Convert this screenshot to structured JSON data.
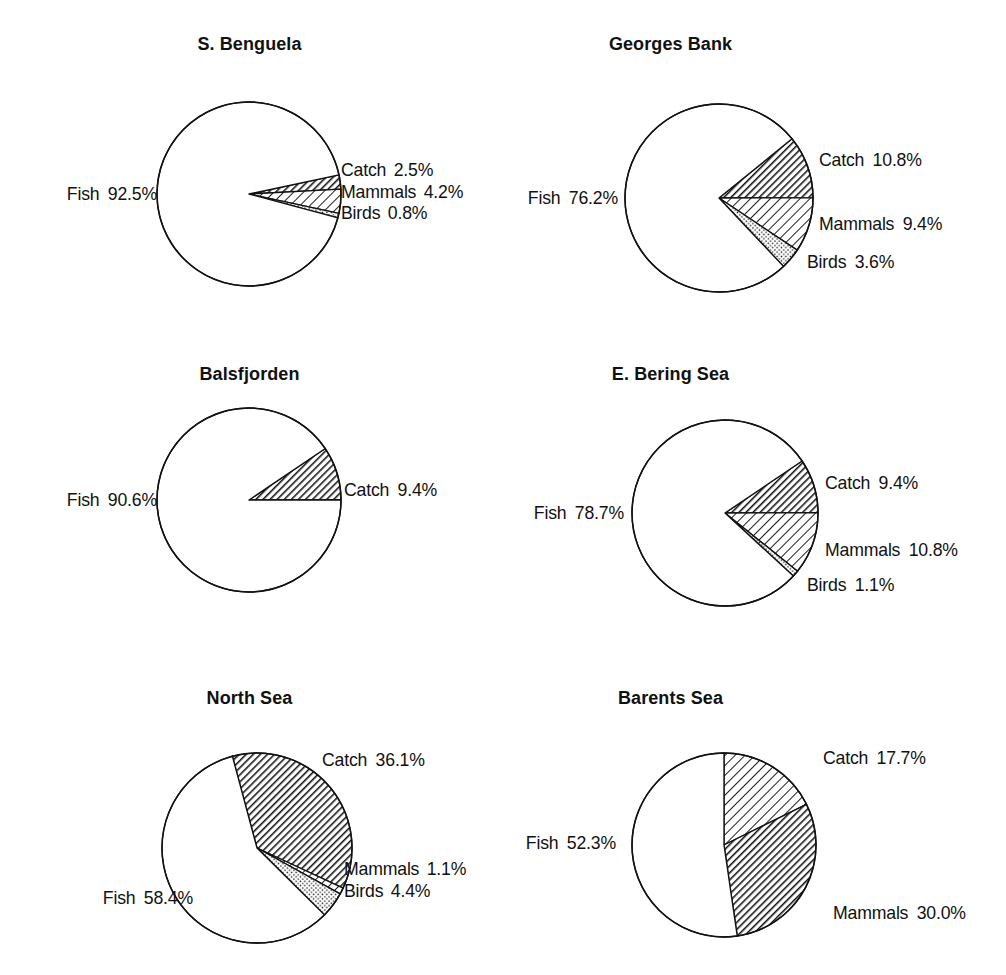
{
  "figure": {
    "background": "#ffffff",
    "stroke_color": "#111111",
    "text_color": "#111111",
    "footer_faint_text": "",
    "series_names": [
      "Fish",
      "Catch",
      "Mammals",
      "Birds"
    ],
    "pattern_legend": {
      "fish": "white / unfilled",
      "catch": "dense diagonal hatch",
      "mammals": "wide diagonal hatch",
      "birds": "stippled dots"
    }
  },
  "chart_data": [
    {
      "type": "pie",
      "title": "S. Benguela",
      "labels": [
        "Fish",
        "Catch",
        "Mammals",
        "Birds"
      ],
      "values": [
        92.5,
        2.5,
        4.2,
        0.8
      ],
      "value_labels": [
        "92.5%",
        "2.5%",
        "4.2%",
        "0.8%"
      ],
      "patterns": [
        "none",
        "hatch-dense",
        "hatch-wide",
        "dots"
      ],
      "start_angle_deg": -12,
      "center": [
        249,
        194
      ],
      "radius": 92
    },
    {
      "type": "pie",
      "title": "Georges Bank",
      "labels": [
        "Fish",
        "Catch",
        "Mammals",
        "Birds"
      ],
      "values": [
        76.2,
        10.8,
        9.4,
        3.6
      ],
      "value_labels": [
        "76.2%",
        "10.8%",
        "9.4%",
        "3.6%"
      ],
      "patterns": [
        "none",
        "hatch-dense",
        "hatch-wide",
        "dots"
      ],
      "start_angle_deg": -39,
      "center": [
        216,
        198
      ],
      "radius": 94
    },
    {
      "type": "pie",
      "title": "Balsfjorden",
      "labels": [
        "Fish",
        "Catch"
      ],
      "values": [
        90.6,
        9.4
      ],
      "value_labels": [
        "90.6%",
        "9.4%"
      ],
      "patterns": [
        "none",
        "hatch-dense"
      ],
      "start_angle_deg": -34,
      "center": [
        249,
        170
      ],
      "radius": 92
    },
    {
      "type": "pie",
      "title": "E. Bering Sea",
      "labels": [
        "Fish",
        "Catch",
        "Mammals",
        "Birds"
      ],
      "values": [
        78.7,
        9.4,
        10.8,
        1.1
      ],
      "value_labels": [
        "78.7%",
        "9.4%",
        "10.8%",
        "1.1%"
      ],
      "patterns": [
        "none",
        "hatch-dense",
        "hatch-wide",
        "dots"
      ],
      "start_angle_deg": -34,
      "center": [
        222,
        183
      ],
      "radius": 93
    },
    {
      "type": "pie",
      "title": "North Sea",
      "labels": [
        "Fish",
        "Catch",
        "Mammals",
        "Birds"
      ],
      "values": [
        58.4,
        36.1,
        1.1,
        4.4
      ],
      "value_labels": [
        "58.4%",
        "36.1%",
        "1.1%",
        "4.4%"
      ],
      "patterns": [
        "none",
        "hatch-dense",
        "hatch-wide",
        "dots"
      ],
      "start_angle_deg": -105,
      "center": [
        257,
        188
      ],
      "radius": 95
    },
    {
      "type": "pie",
      "title": "Barents Sea",
      "labels": [
        "Fish",
        "Catch",
        "Mammals"
      ],
      "values": [
        52.3,
        17.7,
        30.0
      ],
      "value_labels": [
        "52.3%",
        "17.7%",
        "30.0%"
      ],
      "patterns": [
        "none",
        "hatch-wide",
        "hatch-dense"
      ],
      "start_angle_deg": -90,
      "center": [
        221,
        185
      ],
      "radius": 92
    }
  ],
  "panels": [
    {
      "title": "S. Benguela",
      "fish_label": "Fish",
      "fish_value": "92.5%",
      "right_rows": [
        {
          "name": "Catch",
          "value": "2.5%"
        },
        {
          "name": "Mammals",
          "value": "4.2%"
        },
        {
          "name": "Birds",
          "value": "0.8%"
        }
      ]
    },
    {
      "title": "Georges Bank",
      "fish_label": "Fish",
      "fish_value": "76.2%",
      "right_rows": [
        {
          "name": "Catch",
          "value": "10.8%"
        },
        {
          "name": "Mammals",
          "value": "9.4%"
        },
        {
          "name": "Birds",
          "value": "3.6%"
        }
      ]
    },
    {
      "title": "Balsfjorden",
      "fish_label": "Fish",
      "fish_value": "90.6%",
      "right_rows": [
        {
          "name": "Catch",
          "value": "9.4%"
        }
      ]
    },
    {
      "title": "E. Bering Sea",
      "fish_label": "Fish",
      "fish_value": "78.7%",
      "right_rows": [
        {
          "name": "Catch",
          "value": "9.4%"
        },
        {
          "name": "Mammals",
          "value": "10.8%"
        },
        {
          "name": "Birds",
          "value": "1.1%"
        }
      ]
    },
    {
      "title": "North Sea",
      "fish_label": "Fish",
      "fish_value": "58.4%",
      "right_rows": [
        {
          "name": "Catch",
          "value": "36.1%"
        },
        {
          "name": "Mammals",
          "value": "1.1%"
        },
        {
          "name": "Birds",
          "value": "4.4%"
        }
      ]
    },
    {
      "title": "Barents Sea",
      "fish_label": "Fish",
      "fish_value": "52.3%",
      "right_rows": [
        {
          "name": "Catch",
          "value": "17.7%"
        },
        {
          "name": "Mammals",
          "value": "30.0%"
        }
      ]
    }
  ]
}
